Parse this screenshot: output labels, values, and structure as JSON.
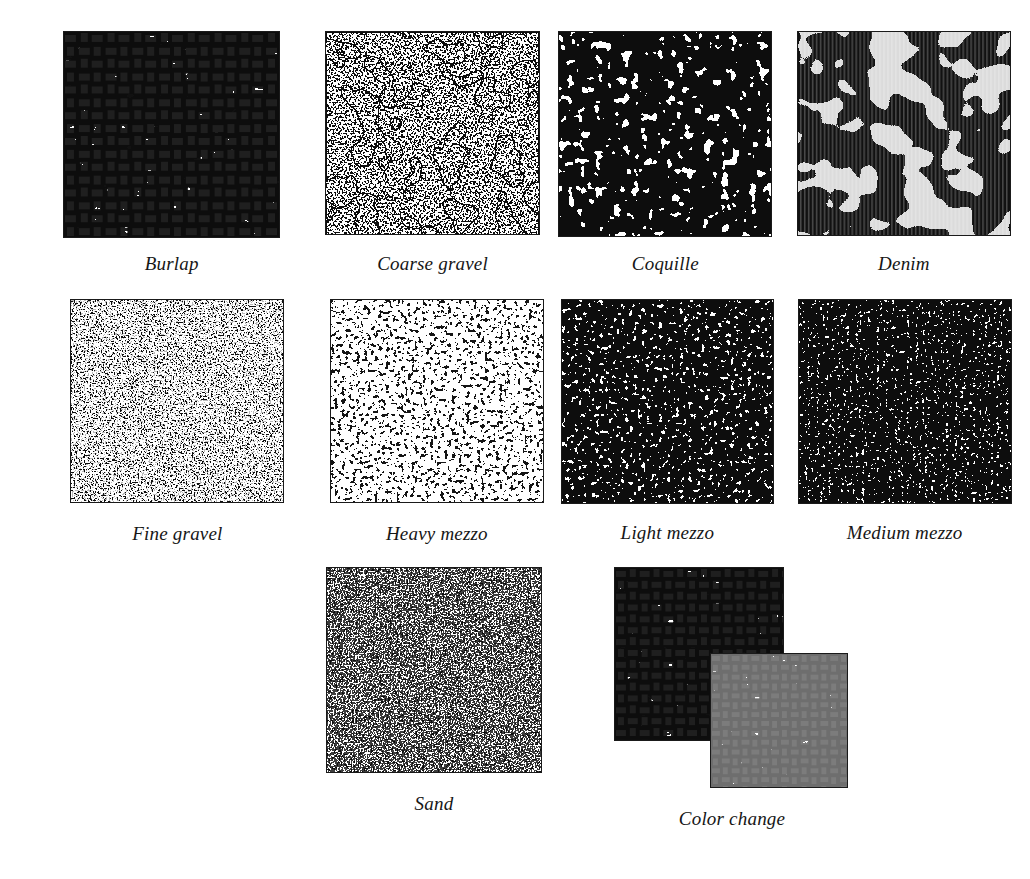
{
  "figure": {
    "background_color": "#ffffff",
    "ink_color": "#161616",
    "caption_style": "italic-serif"
  },
  "rows": [
    {
      "name": "row-1",
      "cells": [
        {
          "id": "burlap",
          "label": "Burlap",
          "pattern": "burlap",
          "tone": "dark",
          "ink": "#111111",
          "paper": "#ffffff"
        },
        {
          "id": "coarse-gravel",
          "label": "Coarse gravel",
          "pattern": "coarse-gravel",
          "tone": "light",
          "ink": "#111111",
          "paper": "#ffffff"
        },
        {
          "id": "coquille",
          "label": "Coquille",
          "pattern": "coquille",
          "tone": "light",
          "ink": "#111111",
          "paper": "#ffffff"
        },
        {
          "id": "denim",
          "label": "Denim",
          "pattern": "denim",
          "tone": "very-dark",
          "ink": "#111111",
          "paper": "#ffffff"
        }
      ]
    },
    {
      "name": "row-2",
      "cells": [
        {
          "id": "fine-gravel",
          "label": "Fine gravel",
          "pattern": "fine-gravel",
          "tone": "very-light",
          "ink": "#111111",
          "paper": "#ffffff"
        },
        {
          "id": "heavy-mezzo",
          "label": "Heavy mezzo",
          "pattern": "heavy-mezzo",
          "tone": "very-dark",
          "ink": "#111111",
          "paper": "#ffffff"
        },
        {
          "id": "light-mezzo",
          "label": "Light mezzo",
          "pattern": "light-mezzo",
          "tone": "medium",
          "ink": "#111111",
          "paper": "#ffffff"
        },
        {
          "id": "medium-mezzo",
          "label": "Medium mezzo",
          "pattern": "medium-mezzo",
          "tone": "medium",
          "ink": "#111111",
          "paper": "#ffffff"
        }
      ]
    },
    {
      "name": "row-3",
      "cells": [
        {
          "id": "sand",
          "label": "Sand",
          "pattern": "sand",
          "tone": "light",
          "ink": "#111111",
          "paper": "#ffffff"
        },
        {
          "id": "color-change",
          "label": "Color change",
          "pattern": "color-change",
          "tone": "dark",
          "ink": "#111111",
          "paper": "#ffffff",
          "layers": [
            {
              "name": "back-swatch",
              "pattern": "burlap",
              "color": "#111111"
            },
            {
              "name": "front-swatch",
              "pattern": "burlap",
              "color": "#6e6e6e"
            }
          ]
        }
      ]
    }
  ]
}
